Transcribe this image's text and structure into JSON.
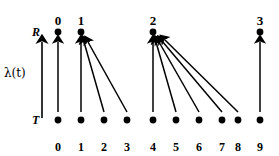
{
  "figure": {
    "name": "time-mapping-diagram",
    "axis_label": "λ(t)",
    "row_labels": {
      "receiver": "R",
      "transmitter": "T"
    },
    "colors": {
      "ink": "#000000",
      "background": "#ffffff"
    }
  },
  "top_axis": {
    "name": "receiver-axis",
    "ticks": [
      {
        "label": "0",
        "x": 58
      },
      {
        "label": "1",
        "x": 81
      },
      {
        "label": "2",
        "x": 153
      },
      {
        "label": "3",
        "x": 260
      }
    ],
    "y_label": 14,
    "y_dot": 32
  },
  "bottom_axis": {
    "name": "transmitter-axis",
    "ticks": [
      {
        "label": "0",
        "x": 58
      },
      {
        "label": "1",
        "x": 81
      },
      {
        "label": "2",
        "x": 104
      },
      {
        "label": "3",
        "x": 127
      },
      {
        "label": "4",
        "x": 153
      },
      {
        "label": "5",
        "x": 176
      },
      {
        "label": "6",
        "x": 199
      },
      {
        "label": "7",
        "x": 222
      },
      {
        "label": "8",
        "x": 238
      },
      {
        "label": "9",
        "x": 260
      }
    ],
    "y_label": 141,
    "y_dot": 120
  },
  "mappings": [
    {
      "from": "0",
      "to": "0",
      "x1": 58,
      "y1": 112,
      "x2": 58,
      "y2": 42
    },
    {
      "from": "1",
      "to": "1",
      "x1": 81,
      "y1": 112,
      "x2": 81,
      "y2": 42
    },
    {
      "from": "2",
      "to": "1",
      "x1": 104,
      "y1": 112,
      "x2": 84,
      "y2": 42
    },
    {
      "from": "3",
      "to": "1",
      "x1": 127,
      "y1": 112,
      "x2": 88,
      "y2": 42
    },
    {
      "from": "4",
      "to": "2",
      "x1": 153,
      "y1": 112,
      "x2": 153,
      "y2": 42
    },
    {
      "from": "5",
      "to": "2",
      "x1": 176,
      "y1": 112,
      "x2": 156,
      "y2": 42
    },
    {
      "from": "6",
      "to": "2",
      "x1": 199,
      "y1": 112,
      "x2": 159,
      "y2": 42
    },
    {
      "from": "7",
      "to": "2",
      "x1": 222,
      "y1": 112,
      "x2": 162,
      "y2": 41
    },
    {
      "from": "8",
      "to": "2",
      "x1": 238,
      "y1": 112,
      "x2": 165,
      "y2": 40
    },
    {
      "from": "9",
      "to": "3",
      "x1": 260,
      "y1": 112,
      "x2": 260,
      "y2": 42
    }
  ],
  "lambda_axis": {
    "name": "lambda-axis-arrow",
    "x": 42,
    "y1": 118,
    "y2": 42,
    "label": "λ(t)",
    "label_x": 4,
    "label_y": 66
  }
}
